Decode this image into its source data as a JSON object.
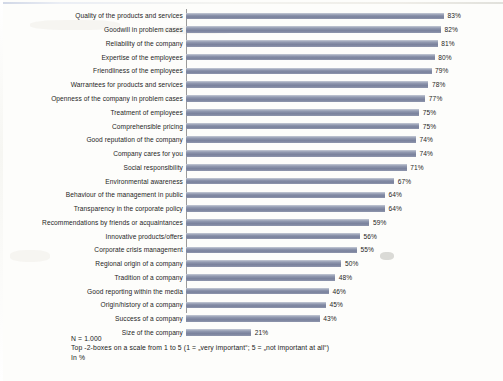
{
  "chart_data": {
    "type": "bar",
    "orientation": "horizontal",
    "title": "",
    "subtitle": "",
    "xlabel": "",
    "ylabel": "",
    "xlim": [
      0,
      100
    ],
    "grid": false,
    "legend": false,
    "value_suffix": "%",
    "categories": [
      "Quality of the products and services",
      "Goodwill in problem cases",
      "Reliability of the company",
      "Expertise of the employees",
      "Friendliness of the employees",
      "Warrantees for products and services",
      "Openness of the company in problem cases",
      "Treatment of employees",
      "Comprehensible pricing",
      "Good reputation of the company",
      "Company cares for you",
      "Social responsibility",
      "Environmental awareness",
      "Behaviour of the management in public",
      "Transparency in the corporate policy",
      "Recommendations by friends or acquaintances",
      "Innovative products/offers",
      "Corporate crisis management",
      "Regional origin of a company",
      "Tradition of a company",
      "Good reporting within the media",
      "Origin/history of a company",
      "Success of a company",
      "Size of the company"
    ],
    "values": [
      83,
      82,
      81,
      80,
      79,
      78,
      77,
      75,
      75,
      74,
      74,
      71,
      67,
      64,
      64,
      59,
      56,
      55,
      50,
      48,
      46,
      45,
      43,
      21
    ],
    "value_labels": [
      "83%",
      "82%",
      "81%",
      "80%",
      "79%",
      "78%",
      "77%",
      "75%",
      "75%",
      "74%",
      "74%",
      "71%",
      "67%",
      "64%",
      "64%",
      "59%",
      "56%",
      "55%",
      "50%",
      "48%",
      "46%",
      "45%",
      "43%",
      "21%"
    ],
    "bar_color": "#8b93ab",
    "background_color": "#fdfdfb",
    "text_color": "#1d1d1d"
  },
  "footnotes": {
    "line1": "N = 1.000",
    "line2": "Top -2-boxes on a scale from 1 to 5 (1 = „very important“;  5 = „not important at all“)",
    "line3": "In %"
  }
}
